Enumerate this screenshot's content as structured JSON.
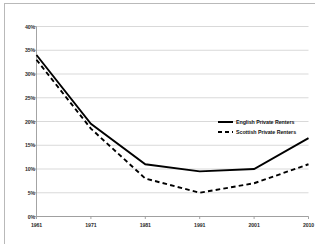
{
  "chart_data": {
    "type": "line",
    "title": "",
    "subtitle": "",
    "xlabel": "",
    "ylabel": "",
    "x": [
      "1961",
      "1971",
      "1981",
      "1991",
      "2001",
      "2010"
    ],
    "categories": [
      "1961",
      "1971",
      "1981",
      "1991",
      "2001",
      "2010"
    ],
    "series": [
      {
        "name": "English Private Renters",
        "style": "solid",
        "color": "#000000",
        "values": [
          34,
          19.5,
          11,
          9.5,
          10,
          16.5
        ]
      },
      {
        "name": "Scottish Private Renters",
        "style": "dashed",
        "color": "#000000",
        "values": [
          33,
          18.5,
          8,
          5,
          7,
          11
        ]
      }
    ],
    "ylim": [
      0,
      40
    ],
    "xlim": [
      "1961",
      "2010"
    ],
    "ytick_values": [
      0,
      5,
      10,
      15,
      20,
      25,
      30,
      35,
      40
    ],
    "ytick_labels": [
      "0%",
      "5%",
      "10%",
      "15%",
      "20%",
      "25%",
      "30%",
      "35%",
      "40%"
    ],
    "xtick_labels": [
      "1961",
      "1971",
      "1981",
      "1991",
      "2001",
      "2010"
    ],
    "grid": "horizontal",
    "grid_color": "#c8c8c8",
    "axis_color": "#9a9a9a",
    "legend_position": "top-right-inside",
    "plot_background": "#ffffff"
  },
  "legend": {
    "entries": [
      {
        "label": "English Private Renters",
        "style": "solid"
      },
      {
        "label": "Scottish Private Renters",
        "style": "dashed"
      }
    ]
  },
  "axes": {
    "y_labels": [
      "40%",
      "35%",
      "30%",
      "25%",
      "20%",
      "15%",
      "10%",
      "5%",
      "0%"
    ],
    "x_labels": [
      "1961",
      "1971",
      "1981",
      "1991",
      "2001",
      "2010"
    ]
  }
}
